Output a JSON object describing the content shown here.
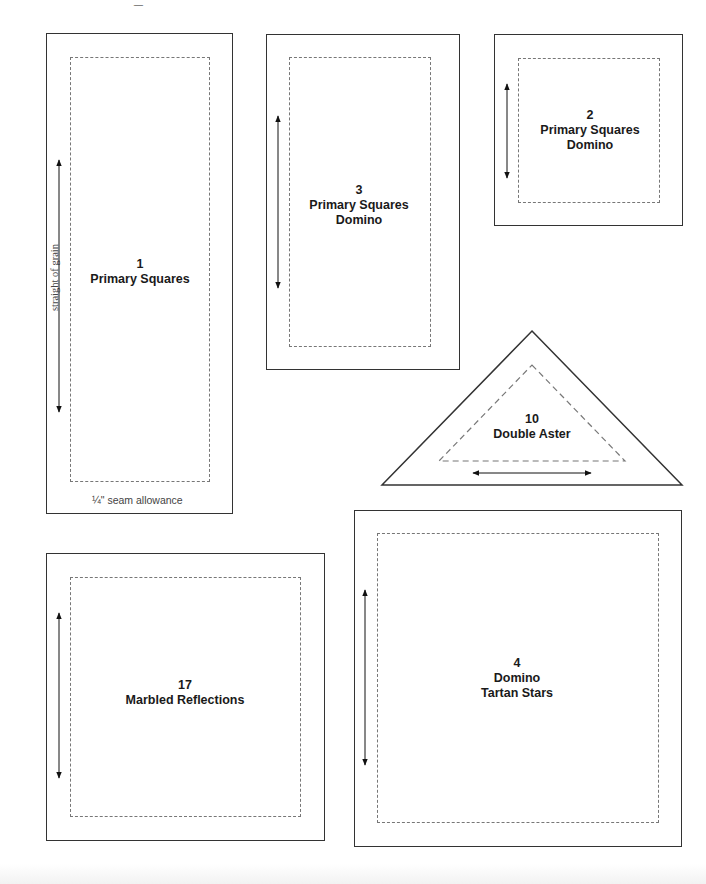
{
  "page": {
    "top_fragment": "_"
  },
  "pieces": [
    {
      "id": "piece-1",
      "number": "1",
      "names": [
        "Primary Squares"
      ],
      "shape": "rectangle",
      "grain": "vertical"
    },
    {
      "id": "piece-3",
      "number": "3",
      "names": [
        "Primary Squares",
        "Domino"
      ],
      "shape": "rectangle",
      "grain": "vertical"
    },
    {
      "id": "piece-2",
      "number": "2",
      "names": [
        "Primary Squares",
        "Domino"
      ],
      "shape": "square",
      "grain": "vertical"
    },
    {
      "id": "piece-10",
      "number": "10",
      "names": [
        "Double Aster"
      ],
      "shape": "triangle",
      "grain": "horizontal"
    },
    {
      "id": "piece-17",
      "number": "17",
      "names": [
        "Marbled Reflections"
      ],
      "shape": "square",
      "grain": "vertical"
    },
    {
      "id": "piece-4",
      "number": "4",
      "names": [
        "Domino",
        "Tartan Stars"
      ],
      "shape": "square",
      "grain": "vertical"
    }
  ],
  "annotations": {
    "grain_label": "straight of grain",
    "seam_label": "¼\" seam allowance"
  },
  "colors": {
    "outline": "#333333",
    "seam_line": "#777777",
    "text": "#1a1a1a",
    "background": "#ffffff"
  }
}
